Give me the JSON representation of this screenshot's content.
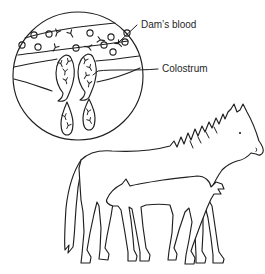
{
  "palette": {
    "background": "#ffffff",
    "ink": "#1f1f1f"
  },
  "labels": {
    "dams_blood": "Dam’s blood",
    "colostrum": "Colostrum"
  },
  "inset": {
    "blood_cells": [
      [
        34,
        35
      ],
      [
        49,
        34
      ],
      [
        90,
        33
      ],
      [
        111,
        37
      ],
      [
        127,
        33
      ],
      [
        22,
        45
      ],
      [
        38,
        47
      ],
      [
        76,
        48
      ],
      [
        104,
        45
      ],
      [
        113,
        52
      ],
      [
        125,
        42
      ]
    ],
    "blood_antibodies": [
      [
        57,
        33,
        20
      ],
      [
        71,
        34,
        -30
      ],
      [
        101,
        40,
        -80
      ],
      [
        55,
        48,
        30
      ],
      [
        88,
        47,
        100
      ],
      [
        119,
        44,
        -45
      ]
    ],
    "gland_antibodies": [
      [
        61,
        64,
        -25
      ],
      [
        68,
        62,
        30
      ],
      [
        65,
        72,
        5
      ],
      [
        66,
        81,
        -15
      ],
      [
        85,
        61,
        20
      ],
      [
        90,
        68,
        -30
      ],
      [
        86,
        76,
        35
      ],
      [
        89,
        84,
        10
      ]
    ],
    "droplet_antibodies": [
      [
        65,
        117,
        -20
      ],
      [
        68,
        126,
        25
      ],
      [
        88,
        112,
        15
      ],
      [
        90,
        121,
        -30
      ]
    ]
  }
}
